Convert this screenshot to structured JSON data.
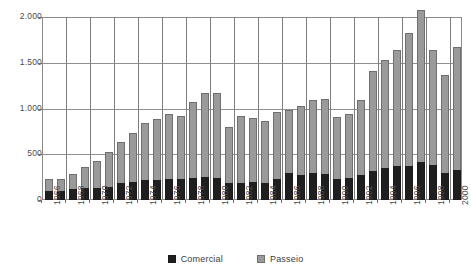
{
  "chart_data": {
    "type": "bar",
    "subtype": "stacked",
    "title": "",
    "xlabel": "",
    "ylabel": "",
    "ylim": [
      0,
      2000
    ],
    "yticks": [
      0,
      500,
      1000,
      1500,
      2000
    ],
    "ytick_labels": [
      "0",
      "500",
      "1.000",
      "1.500",
      "2.000"
    ],
    "grid": true,
    "legend_position": "bottom",
    "categories": [
      "1966",
      "1967",
      "1968",
      "1969",
      "1970",
      "1971",
      "1972",
      "1973",
      "1974",
      "1975",
      "1976",
      "1977",
      "1978",
      "1979",
      "1980",
      "1981",
      "1982",
      "1983",
      "1984",
      "1985",
      "1986",
      "1987",
      "1988",
      "1989",
      "1990",
      "1991",
      "1992",
      "1993",
      "1994",
      "1995",
      "1996",
      "1997",
      "1998",
      "1999",
      "2000"
    ],
    "tick_labels_shown": [
      "1966",
      "1968",
      "1970",
      "1972",
      "1974",
      "1976",
      "1978",
      "1980",
      "1982",
      "1984",
      "1986",
      "1988",
      "1990",
      "1992",
      "1994",
      "1996",
      "1998",
      "2000"
    ],
    "series": [
      {
        "name": "Comercial",
        "color": "#1f1f1f",
        "values": [
          100,
          95,
          125,
          135,
          135,
          145,
          185,
          200,
          215,
          215,
          230,
          235,
          245,
          250,
          240,
          185,
          185,
          195,
          190,
          235,
          290,
          270,
          290,
          285,
          230,
          245,
          275,
          320,
          350,
          375,
          370,
          420,
          385,
          290,
          330
        ]
      },
      {
        "name": "Passeio",
        "color": "#9a9a9a",
        "values": [
          125,
          130,
          160,
          230,
          290,
          380,
          445,
          530,
          630,
          675,
          715,
          680,
          830,
          920,
          925,
          615,
          730,
          700,
          670,
          730,
          690,
          760,
          800,
          815,
          680,
          700,
          820,
          1095,
          1180,
          1260,
          1450,
          1660,
          1250,
          1080,
          1340
        ]
      }
    ],
    "totals": [
      225,
      225,
      285,
      365,
      425,
      525,
      630,
      730,
      845,
      890,
      945,
      915,
      1075,
      1170,
      1165,
      800,
      915,
      895,
      860,
      965,
      980,
      1030,
      1090,
      1100,
      910,
      945,
      1095,
      1415,
      1530,
      1635,
      1820,
      2080,
      1635,
      1370,
      1670
    ]
  },
  "legend": {
    "items": [
      {
        "label": "Comercial",
        "swatch": "black-square-icon"
      },
      {
        "label": "Passeio",
        "swatch": "gray-square-icon"
      }
    ]
  }
}
